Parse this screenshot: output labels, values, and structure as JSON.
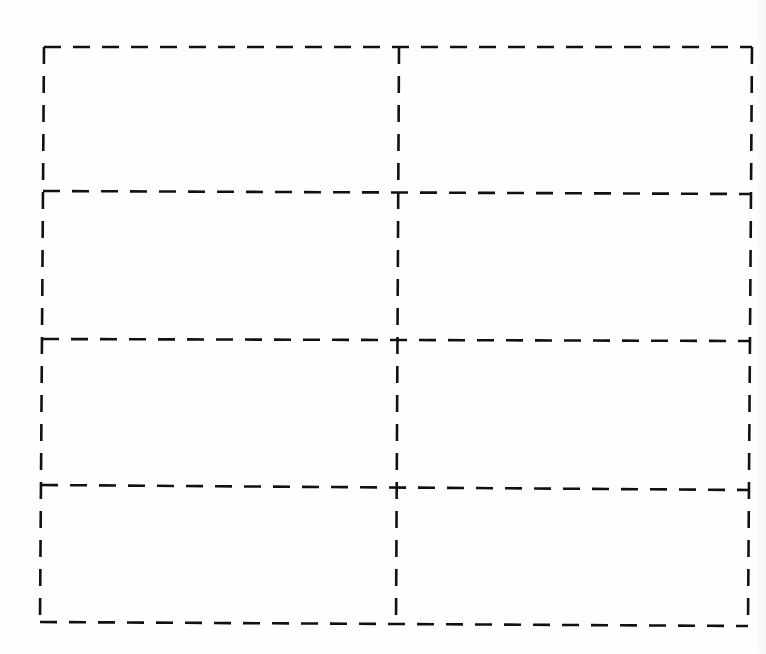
{
  "page": {
    "grid": {
      "columns": 2,
      "rows": 4,
      "line_style": "dashed",
      "line_color": "#111111"
    }
  },
  "cells": [
    {
      "row": 1,
      "col": 1
    },
    {
      "row": 1,
      "col": 2
    },
    {
      "row": 2,
      "col": 1
    },
    {
      "row": 2,
      "col": 2
    },
    {
      "row": 3,
      "col": 1
    },
    {
      "row": 3,
      "col": 2
    },
    {
      "row": 4,
      "col": 1
    },
    {
      "row": 4,
      "col": 2
    }
  ]
}
